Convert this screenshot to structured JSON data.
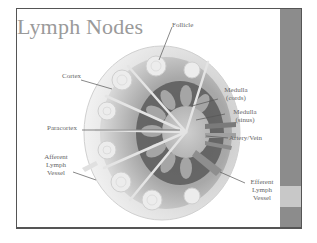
{
  "slide": {
    "title": "Lymph Nodes",
    "colors": {
      "side_bar": "#8c8c8c",
      "side_bar_accent": "#c8c8c8",
      "title": "#9a9a9a",
      "label": "#666666"
    }
  },
  "diagram": {
    "labels": {
      "follicle": "Follicle",
      "cortex": "Cortex",
      "medulla_cords_1": "Medulla",
      "medulla_cords_2": "(cords)",
      "medulla_sinus_1": "Medulla",
      "medulla_sinus_2": "(sinus)",
      "paracortex": "Paracortex",
      "artery_vein": "Artery/Vein",
      "afferent_1": "Afferent",
      "afferent_2": "Lymph",
      "afferent_3": "Vessel",
      "efferent_1": "Efferent",
      "efferent_2": "Lymph",
      "efferent_3": "Vessel"
    }
  }
}
